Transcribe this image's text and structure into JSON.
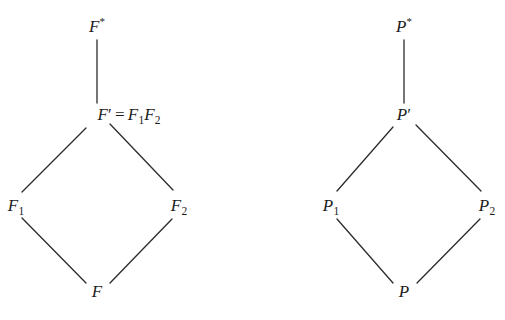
{
  "figure": {
    "background_color": "#ffffff",
    "line_color": "#2b2b2b",
    "text_color": "#1c1c1c",
    "line_width": 1.3,
    "type": "lattice-diagram-pair"
  },
  "diagrams": [
    {
      "id": "field-lattice",
      "name": "field-extension-lattice",
      "nodes": [
        {
          "id": "F-star",
          "label_html": "F<sup>*</sup>",
          "plain": "F*",
          "x": 97,
          "y": 26
        },
        {
          "id": "F-prime",
          "label_html": "F<span class=\"prime\">′</span><span class=\"eq\">=</span>F<sub>1</sub>F<sub>2</sub>",
          "plain": "F' = F1F2",
          "x": 129,
          "y": 114
        },
        {
          "id": "F-one",
          "label_html": "F<sub>1</sub>",
          "plain": "F1",
          "x": 16,
          "y": 205
        },
        {
          "id": "F-two",
          "label_html": "F<sub>2</sub>",
          "plain": "F2",
          "x": 179,
          "y": 205
        },
        {
          "id": "F-base",
          "label_html": "F",
          "plain": "F",
          "x": 97,
          "y": 291
        }
      ],
      "edges": [
        {
          "id": "F-star--F-prime",
          "from": "F-star",
          "to": "F-prime",
          "x1": 97,
          "y1": 40,
          "x2": 97,
          "y2": 103
        },
        {
          "id": "F-prime--F-one",
          "from": "F-prime",
          "to": "F-one",
          "x1": 86,
          "y1": 128,
          "x2": 22,
          "y2": 192
        },
        {
          "id": "F-prime--F-two",
          "from": "F-prime",
          "to": "F-two",
          "x1": 110,
          "y1": 124,
          "x2": 173,
          "y2": 190
        },
        {
          "id": "F-one--F-base",
          "from": "F-one",
          "to": "F-base",
          "x1": 22,
          "y1": 218,
          "x2": 86,
          "y2": 283
        },
        {
          "id": "F-two--F-base",
          "from": "F-two",
          "to": "F-base",
          "x1": 172,
          "y1": 219,
          "x2": 110,
          "y2": 283
        }
      ]
    },
    {
      "id": "group-lattice",
      "name": "group-lattice",
      "nodes": [
        {
          "id": "P-star",
          "label_html": "P<sup>*</sup>",
          "plain": "P*",
          "x": 404,
          "y": 26
        },
        {
          "id": "P-prime",
          "label_html": "P<span class=\"prime\">′</span>",
          "plain": "P'",
          "x": 404,
          "y": 114
        },
        {
          "id": "P-one",
          "label_html": "P<sub>1</sub>",
          "plain": "P1",
          "x": 331,
          "y": 205
        },
        {
          "id": "P-two",
          "label_html": "P<sub>2</sub>",
          "plain": "P2",
          "x": 487,
          "y": 205
        },
        {
          "id": "P-base",
          "label_html": "P",
          "plain": "P",
          "x": 404,
          "y": 291
        }
      ],
      "edges": [
        {
          "id": "P-star--P-prime",
          "from": "P-star",
          "to": "P-prime",
          "x1": 404,
          "y1": 40,
          "x2": 404,
          "y2": 103
        },
        {
          "id": "P-prime--P-one",
          "from": "P-prime",
          "to": "P-one",
          "x1": 393,
          "y1": 127,
          "x2": 337,
          "y2": 191
        },
        {
          "id": "P-prime--P-two",
          "from": "P-prime",
          "to": "P-two",
          "x1": 416,
          "y1": 125,
          "x2": 481,
          "y2": 191
        },
        {
          "id": "P-one--P-base",
          "from": "P-one",
          "to": "P-base",
          "x1": 337,
          "y1": 219,
          "x2": 393,
          "y2": 283
        },
        {
          "id": "P-two--P-base",
          "from": "P-two",
          "to": "P-base",
          "x1": 480,
          "y1": 219,
          "x2": 417,
          "y2": 283
        }
      ]
    }
  ]
}
